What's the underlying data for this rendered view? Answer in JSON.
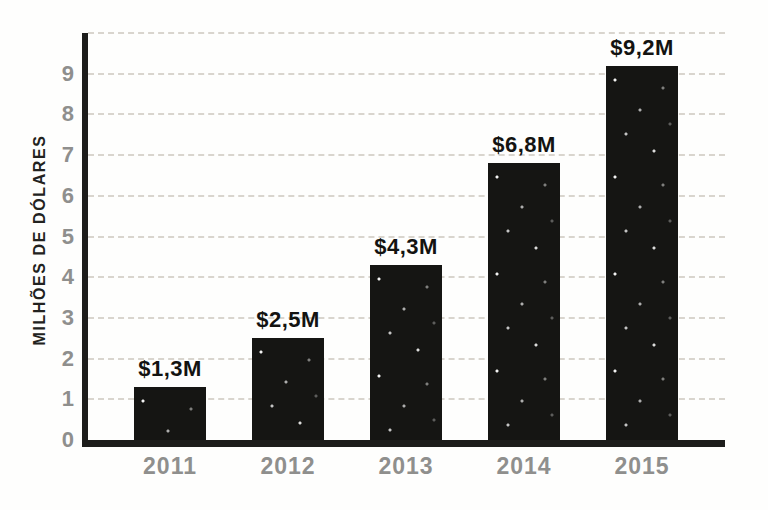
{
  "chart_data": {
    "type": "bar",
    "title": "",
    "categories": [
      "2011",
      "2012",
      "2013",
      "2014",
      "2015"
    ],
    "values": [
      1.3,
      2.5,
      4.3,
      6.8,
      9.2
    ],
    "value_labels": [
      "$1,3M",
      "$2,5M",
      "$4,3M",
      "$6,8M",
      "$9,2M"
    ],
    "xlabel": "",
    "ylabel": "MILHÕES DE DÓLARES",
    "ylim": [
      0,
      10
    ],
    "yticks": [
      0,
      1,
      2,
      3,
      4,
      5,
      6,
      7,
      8,
      9
    ],
    "gridline_values": [
      1,
      2,
      3,
      4,
      5,
      6,
      7,
      8,
      9,
      10
    ],
    "grid": "horizontal-dashed",
    "legend": "none",
    "colors": {
      "bar": "#151513",
      "axis": "#1d1d1b",
      "tick_label": "#8f8f8d",
      "value_label": "#131311",
      "gridline": "#d9d5ce",
      "background": "#fefefd"
    }
  }
}
